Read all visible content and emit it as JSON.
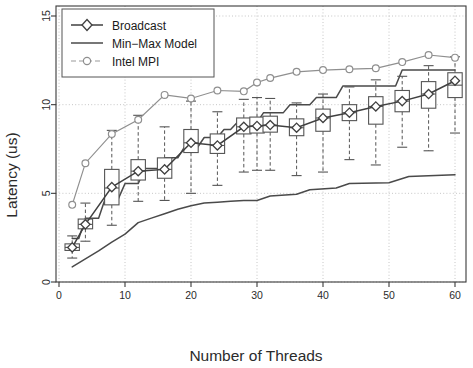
{
  "chart_data": {
    "type": "scatter",
    "title": "",
    "xlabel": "Number of Threads",
    "ylabel": "Latency (us)",
    "xlim": [
      0,
      62
    ],
    "ylim": [
      0,
      15.6
    ],
    "xticks": [
      0,
      10,
      20,
      30,
      40,
      50,
      60
    ],
    "yticks": [
      0,
      5,
      10,
      15
    ],
    "grid": true,
    "grid_style": "dotted",
    "legend_position": "top-left",
    "legend": [
      "Broadcast",
      "Min−Max Model",
      "Intel MPI"
    ],
    "colors": {
      "broadcast": "#404040",
      "minmax": "#4a4a4a",
      "intelmpi": "#8f8f8f",
      "box": "#555555",
      "grid": "#b8b8b8",
      "axis": "#3a3a3a"
    },
    "x": [
      2,
      4,
      8,
      12,
      16,
      20,
      24,
      28,
      30,
      32,
      36,
      40,
      44,
      48,
      52,
      56,
      60
    ],
    "series": [
      {
        "name": "Broadcast",
        "marker": "diamond",
        "values": [
          1.95,
          3.25,
          5.35,
          6.25,
          6.35,
          7.85,
          7.7,
          8.75,
          8.8,
          8.85,
          8.7,
          9.25,
          9.55,
          9.9,
          10.2,
          10.6,
          11.35
        ]
      },
      {
        "name": "Intel MPI",
        "marker": "circle",
        "values": [
          4.35,
          6.7,
          8.35,
          9.15,
          10.55,
          10.35,
          10.8,
          10.75,
          11.25,
          11.5,
          11.85,
          11.95,
          12.0,
          12.05,
          12.4,
          12.8,
          12.65
        ]
      }
    ],
    "boxplots": [
      {
        "x": 2,
        "lower_whisker": 1.35,
        "q1": 1.78,
        "median": 1.95,
        "q3": 2.15,
        "upper_whisker": 2.6
      },
      {
        "x": 4,
        "lower_whisker": 2.3,
        "q1": 3.0,
        "median": 3.25,
        "q3": 3.55,
        "upper_whisker": 4.45
      },
      {
        "x": 8,
        "lower_whisker": 3.2,
        "q1": 4.35,
        "median": 5.3,
        "q3": 6.35,
        "upper_whisker": 8.55
      },
      {
        "x": 12,
        "lower_whisker": 4.55,
        "q1": 5.75,
        "median": 6.25,
        "q3": 6.9,
        "upper_whisker": 9.4
      },
      {
        "x": 16,
        "lower_whisker": 4.6,
        "q1": 5.85,
        "median": 6.35,
        "q3": 7.0,
        "upper_whisker": 8.75
      },
      {
        "x": 20,
        "lower_whisker": 5.0,
        "q1": 7.3,
        "median": 7.85,
        "q3": 8.6,
        "upper_whisker": 10.2
      },
      {
        "x": 24,
        "lower_whisker": 5.45,
        "q1": 7.25,
        "median": 7.7,
        "q3": 8.35,
        "upper_whisker": 9.6
      },
      {
        "x": 28,
        "lower_whisker": 6.2,
        "q1": 8.35,
        "median": 8.75,
        "q3": 9.25,
        "upper_whisker": 10.3
      },
      {
        "x": 30,
        "lower_whisker": 6.3,
        "q1": 8.4,
        "median": 8.8,
        "q3": 9.3,
        "upper_whisker": 10.4
      },
      {
        "x": 32,
        "lower_whisker": 6.3,
        "q1": 8.45,
        "median": 8.85,
        "q3": 9.35,
        "upper_whisker": 10.35
      },
      {
        "x": 36,
        "lower_whisker": 6.0,
        "q1": 8.25,
        "median": 8.7,
        "q3": 9.2,
        "upper_whisker": 10.1
      },
      {
        "x": 40,
        "lower_whisker": 6.2,
        "q1": 8.5,
        "median": 9.25,
        "q3": 9.75,
        "upper_whisker": 10.6
      },
      {
        "x": 44,
        "lower_whisker": 6.9,
        "q1": 9.1,
        "median": 9.55,
        "q3": 10.0,
        "upper_whisker": 11.0
      },
      {
        "x": 48,
        "lower_whisker": 6.6,
        "q1": 8.9,
        "median": 9.9,
        "q3": 10.45,
        "upper_whisker": 11.4
      },
      {
        "x": 52,
        "lower_whisker": 7.6,
        "q1": 9.6,
        "median": 10.2,
        "q3": 10.8,
        "upper_whisker": 11.6
      },
      {
        "x": 56,
        "lower_whisker": 7.4,
        "q1": 9.8,
        "median": 10.6,
        "q3": 11.3,
        "upper_whisker": 12.2
      },
      {
        "x": 60,
        "lower_whisker": 8.4,
        "q1": 10.4,
        "median": 11.1,
        "q3": 11.8,
        "upper_whisker": 12.7
      }
    ],
    "minmax_model_upper": [
      [
        2,
        2.45
      ],
      [
        3,
        2.45
      ],
      [
        4,
        3.6
      ],
      [
        6,
        3.6
      ],
      [
        7,
        4.7
      ],
      [
        9,
        4.7
      ],
      [
        10,
        5.55
      ],
      [
        12,
        5.55
      ],
      [
        13,
        6.4
      ],
      [
        15,
        6.4
      ],
      [
        16,
        7.0
      ],
      [
        18,
        7.0
      ],
      [
        19,
        7.6
      ],
      [
        21,
        7.6
      ],
      [
        22,
        8.15
      ],
      [
        24,
        8.15
      ],
      [
        25,
        8.6
      ],
      [
        26,
        8.6
      ],
      [
        27,
        9.0
      ],
      [
        30,
        9.0
      ],
      [
        31,
        9.55
      ],
      [
        34,
        9.55
      ],
      [
        35,
        10.0
      ],
      [
        38,
        10.0
      ],
      [
        39,
        10.4
      ],
      [
        42,
        10.4
      ],
      [
        43,
        11.05
      ],
      [
        51,
        11.05
      ],
      [
        52,
        11.95
      ],
      [
        60,
        11.95
      ]
    ],
    "minmax_model_lower": [
      [
        2,
        0.85
      ],
      [
        4,
        1.3
      ],
      [
        6,
        1.75
      ],
      [
        8,
        2.25
      ],
      [
        10,
        2.7
      ],
      [
        12,
        3.35
      ],
      [
        14,
        3.6
      ],
      [
        16,
        3.85
      ],
      [
        18,
        4.1
      ],
      [
        20,
        4.3
      ],
      [
        22,
        4.45
      ],
      [
        24,
        4.5
      ],
      [
        26,
        4.55
      ],
      [
        28,
        4.6
      ],
      [
        30,
        4.6
      ],
      [
        32,
        4.85
      ],
      [
        36,
        4.95
      ],
      [
        38,
        5.2
      ],
      [
        42,
        5.3
      ],
      [
        44,
        5.55
      ],
      [
        50,
        5.6
      ],
      [
        53,
        5.95
      ],
      [
        60,
        6.05
      ]
    ]
  },
  "axes": {
    "x_label": "Number of Threads",
    "y_label": "Latency (us)",
    "x_tick_labels": [
      "0",
      "10",
      "20",
      "30",
      "40",
      "50",
      "60"
    ],
    "y_tick_labels": [
      "0",
      "5",
      "10",
      "15"
    ]
  },
  "legend": {
    "items": [
      {
        "label": "Broadcast",
        "marker": "diamond"
      },
      {
        "label": "Min−Max Model",
        "marker": "line"
      },
      {
        "label": "Intel MPI",
        "marker": "circle"
      }
    ]
  }
}
